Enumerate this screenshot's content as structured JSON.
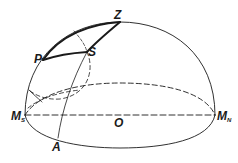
{
  "diagram": {
    "type": "celestial-sphere-hemisphere",
    "colors": {
      "stroke": "#1a1a1a",
      "background": "#ffffff"
    },
    "labels": {
      "zenith": "Z",
      "pole": "P",
      "star": "S",
      "south_point": {
        "main": "M",
        "sub": "S"
      },
      "north_point": {
        "main": "M",
        "sub": "N"
      },
      "center": "O",
      "azimuth_point": "A"
    }
  }
}
